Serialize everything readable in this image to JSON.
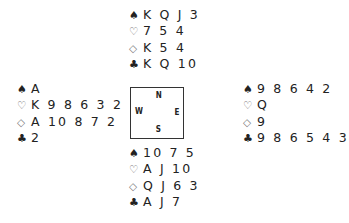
{
  "suits": {
    "spades": "♠",
    "hearts": "♡",
    "diamonds": "◇",
    "clubs": "♣"
  },
  "compass": {
    "north": "N",
    "south": "S",
    "east": "E",
    "west": "W"
  },
  "hands": {
    "north": {
      "spades": "K Q J 3",
      "hearts": "7 5 4",
      "diamonds": "K 5 4",
      "clubs": "K Q 10"
    },
    "west": {
      "spades": "A",
      "hearts": "K 9 8 6 3 2",
      "diamonds": "A 10 8 7 2",
      "clubs": "2"
    },
    "east": {
      "spades": "9 8 6 4 2",
      "hearts": "Q",
      "diamonds": "9",
      "clubs": "9 8 6 5 4 3"
    },
    "south": {
      "spades": "10 7 5",
      "hearts": "A J 10",
      "diamonds": "Q J 6 3",
      "clubs": "A J 7"
    }
  }
}
